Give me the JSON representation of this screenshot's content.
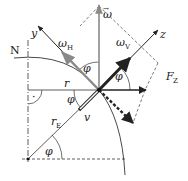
{
  "diagram": {
    "labels": {
      "north": "N",
      "y_axis": "y",
      "z_axis": "z",
      "omega": "ω",
      "omega_h": "ω",
      "omega_h_sub": "H",
      "omega_v": "ω",
      "omega_v_sub": "V",
      "force": "F",
      "force_sub": "Z",
      "radius": "r",
      "earth_radius": "r",
      "earth_radius_sub": "E",
      "velocity": "v",
      "angle_top": "φ",
      "angle_right": "φ",
      "angle_mid": "φ",
      "angle_bottom": "φ",
      "right_angle_dot": "·",
      "vector_arrow": "→"
    },
    "colors": {
      "ink": "#222222",
      "gray_vector": "#8a8a8a",
      "background": "#ffffff"
    }
  }
}
